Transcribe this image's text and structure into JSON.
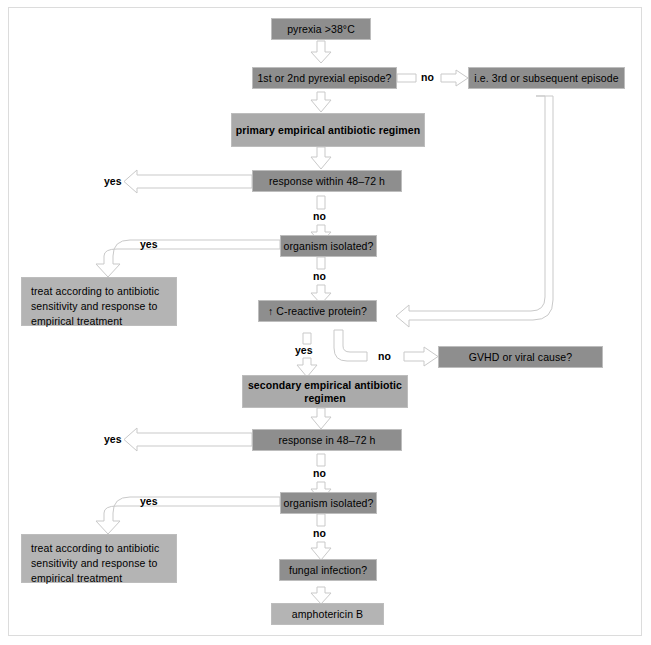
{
  "chart_type": "flowchart",
  "nodes": {
    "pyrexia": "pyrexia  >38°C",
    "episode_q": "1st or 2nd pyrexial episode?",
    "third_episode": "i.e. 3rd or subsequent episode",
    "primary_regimen": "primary empirical antibiotic regimen",
    "response_1": "response within 48–72 h",
    "organism_1": "organism isolated?",
    "treat_1": "treat according to antibiotic sensitivity and response to empirical treatment",
    "crp": "↑ C-reactive protein?",
    "gvhd": "GVHD or viral cause?",
    "secondary_regimen": "secondary empirical antibiotic regimen",
    "response_2": "response in 48–72 h",
    "organism_2": "organism isolated?",
    "treat_2": "treat according to antibiotic sensitivity and response to empirical treatment",
    "fungal": "fungal infection?",
    "amphotericin": "amphotericin B"
  },
  "edge_labels": {
    "episode_no": "no",
    "response1_yes": "yes",
    "response1_no": "no",
    "organism1_yes": "yes",
    "organism1_no": "no",
    "crp_yes": "yes",
    "crp_no": "no",
    "response2_yes": "yes",
    "response2_no": "no",
    "organism2_yes": "yes",
    "organism2_no": "no"
  },
  "colors": {
    "node_dark": "#8e8e8e",
    "node_light": "#aaaaaa",
    "node_pale": "#b4b4b4",
    "connector_stroke": "#c9c9c9",
    "connector_fill": "#ffffff",
    "frame_border": "#dcdcdc",
    "page_background": "#ffffff",
    "text": "#000000"
  }
}
